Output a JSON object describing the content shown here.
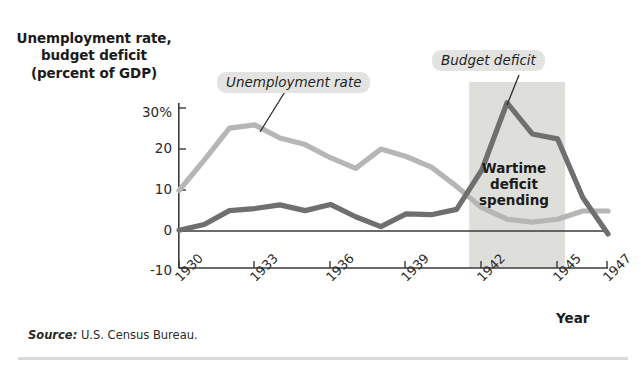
{
  "figure": {
    "y_axis_title": "Unemployment rate,\nbudget deficit\n(percent of GDP)",
    "x_axis_title": "Year",
    "source_lead": "Source:",
    "source_text": " U.S. Census Bureau.",
    "wartime_label": "Wartime\ndeficit\nspending"
  },
  "callouts": {
    "unemployment": "Unemployment rate",
    "budget_deficit": "Budget deficit"
  },
  "colors": {
    "unemployment_line": "#b6b6b4",
    "deficit_line": "#6f6f6f",
    "shaded_band": "#dededa",
    "axis": "#3a3a3a",
    "callout_bg": "#e3e3e1"
  },
  "chart_data": {
    "type": "line",
    "title": "Unemployment rate, budget deficit (percent of GDP)",
    "xlabel": "Year",
    "ylabel": "Unemployment rate, budget deficit (percent of GDP)",
    "xlim": [
      1930,
      1947
    ],
    "ylim": [
      -10,
      30
    ],
    "ytick_labels": [
      "30%",
      "20",
      "10",
      "0",
      "-10"
    ],
    "ytick_values": [
      30,
      20,
      10,
      0,
      -10
    ],
    "xtick_labels": [
      "1930",
      "1933",
      "1936",
      "1939",
      "1942",
      "1945",
      "1947"
    ],
    "xtick_values": [
      1930,
      1933,
      1936,
      1939,
      1942,
      1945,
      1947
    ],
    "grid": false,
    "legend": "inline-annotations",
    "x": [
      1930,
      1931,
      1932,
      1933,
      1934,
      1935,
      1936,
      1937,
      1938,
      1939,
      1940,
      1941,
      1942,
      1943,
      1944,
      1945,
      1946,
      1947
    ],
    "series": [
      {
        "name": "Unemployment rate",
        "color": "#b6b6b4",
        "values": [
          8.9,
          16.3,
          24.1,
          24.9,
          21.7,
          20.1,
          16.9,
          14.3,
          19.0,
          17.2,
          14.6,
          9.9,
          4.7,
          1.9,
          1.2,
          1.9,
          3.9,
          3.9
        ]
      },
      {
        "name": "Budget deficit",
        "color": "#6f6f6f",
        "values": [
          -0.8,
          0.6,
          4.0,
          4.5,
          5.4,
          4.0,
          5.5,
          2.5,
          0.1,
          3.2,
          3.0,
          4.3,
          13.9,
          30.3,
          22.7,
          21.5,
          7.2,
          -1.7
        ]
      }
    ],
    "annotations": [
      {
        "text": "Wartime deficit spending",
        "type": "shaded-region-label",
        "x_start": 1941.5,
        "x_end": 1945.3
      },
      {
        "text": "Unemployment rate",
        "type": "callout",
        "points_to_x": 1934.2,
        "points_to_y": 21.0
      },
      {
        "text": "Budget deficit",
        "type": "callout",
        "points_to_x": 1943.0,
        "points_to_y": 30.3
      }
    ],
    "shaded_regions": [
      {
        "label": "Wartime deficit spending",
        "x_start": 1941.5,
        "x_end": 1945.3,
        "color": "#dededa"
      }
    ]
  }
}
